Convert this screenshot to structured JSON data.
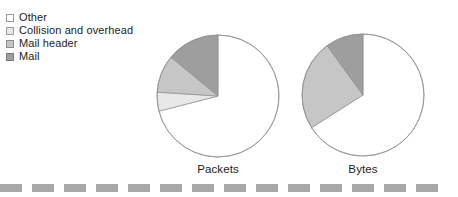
{
  "legend": {
    "items": [
      {
        "label": "Other",
        "color": "#ffffff",
        "border": "#9a9a9a"
      },
      {
        "label": "Collision and overhead",
        "color": "#e8e8e8",
        "border": "#9a9a9a"
      },
      {
        "label": "Mail header",
        "color": "#c6c6c6",
        "border": "#8c8c8c"
      },
      {
        "label": "Mail",
        "color": "#9e9e9e",
        "border": "#7a7a7a"
      }
    ]
  },
  "charts": {
    "packets": {
      "caption": "Packets"
    },
    "bytes": {
      "caption": "Bytes"
    }
  },
  "footer": {
    "dash_color": "#a8a8a8",
    "dash_count": 14,
    "dash_width": 22,
    "dash_gap": 10
  },
  "chart_data": [
    {
      "type": "pie",
      "title": "Packets",
      "labels": [
        "Other",
        "Collision and overhead",
        "Mail header",
        "Mail"
      ],
      "values": [
        71,
        5,
        10,
        14
      ],
      "colors": [
        "#ffffff",
        "#e8e8e8",
        "#c6c6c6",
        "#9e9e9e"
      ],
      "stroke": "#8f8f8f",
      "start_angle_deg": 90,
      "direction": "clockwise",
      "legend_position": "top-left",
      "grid": false
    },
    {
      "type": "pie",
      "title": "Bytes",
      "labels": [
        "Other",
        "Collision and overhead",
        "Mail header",
        "Mail"
      ],
      "values": [
        66,
        0,
        24,
        10
      ],
      "colors": [
        "#ffffff",
        "#e8e8e8",
        "#c6c6c6",
        "#9e9e9e"
      ],
      "stroke": "#8f8f8f",
      "start_angle_deg": 90,
      "direction": "clockwise",
      "legend_position": "top-left",
      "grid": false
    }
  ]
}
